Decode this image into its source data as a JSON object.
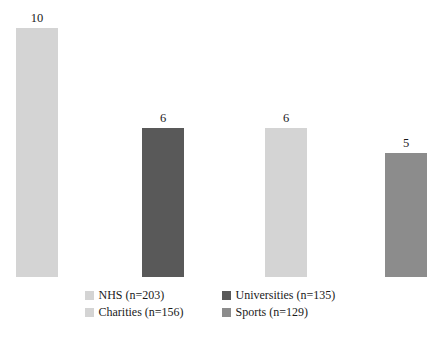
{
  "chart_data": {
    "type": "bar",
    "title": "",
    "subtitle": "",
    "xlabel": "",
    "ylabel": "",
    "categories": [
      "NHS (n=203)",
      "Universities (n=135)",
      "Charities (n=156)",
      "Sports (n=129)"
    ],
    "values": [
      10,
      6,
      6,
      5
    ],
    "value_labels": [
      "10",
      "6",
      "6",
      "5"
    ],
    "colors": [
      "#d4d4d4",
      "#595959",
      "#d4d4d4",
      "#8c8c8c"
    ],
    "ylim": [
      0,
      10
    ],
    "grid": false,
    "axes_visible": false,
    "legend_position": "bottom",
    "series": [
      {
        "name": "Count",
        "values": [
          10,
          6,
          6,
          5
        ]
      }
    ],
    "bars": [
      {
        "label": "NHS (n=203)",
        "value": 10,
        "value_label": "10",
        "color": "#d4d4d4"
      },
      {
        "label": "Universities (n=135)",
        "value": 6,
        "value_label": "6",
        "color": "#595959"
      },
      {
        "label": "Charities (n=156)",
        "value": 6,
        "value_label": "6",
        "color": "#d4d4d4"
      },
      {
        "label": "Sports (n=129)",
        "value": 5,
        "value_label": "5",
        "color": "#8c8c8c"
      }
    ]
  },
  "legend": {
    "rows": [
      [
        {
          "label": "NHS (n=203)",
          "color": "#d4d4d4"
        },
        {
          "label": "Universities (n=135)",
          "color": "#595959"
        }
      ],
      [
        {
          "label": "Charities (n=156)",
          "color": "#d4d4d4"
        },
        {
          "label": "Sports (n=129)",
          "color": "#8c8c8c"
        }
      ]
    ]
  }
}
